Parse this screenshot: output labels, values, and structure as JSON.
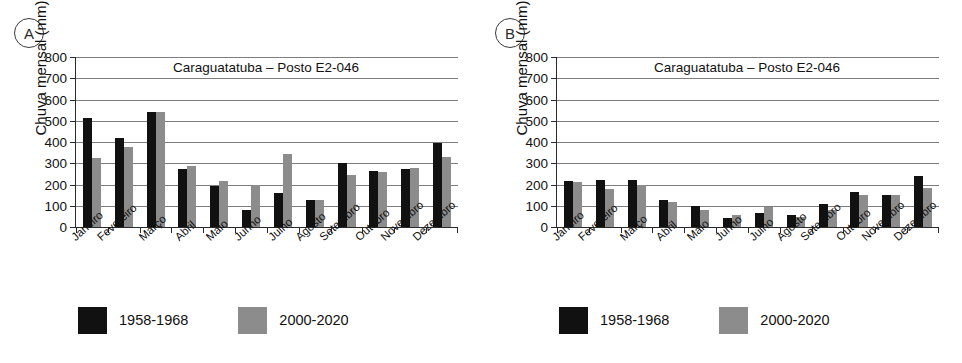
{
  "chart_data": [
    {
      "panel": "A",
      "type": "bar",
      "title": "Caraguatatuba – Posto E2-046",
      "xlabel": "",
      "ylabel": "Chuva mensal (mm)",
      "ylim": [
        0,
        800
      ],
      "yticks": [
        0,
        100,
        200,
        300,
        400,
        500,
        600,
        700,
        800
      ],
      "grid": true,
      "legend_position": "bottom",
      "categories": [
        "Janeiro",
        "Fevereiro",
        "Março",
        "Abril",
        "Maio",
        "Junho",
        "Julho",
        "Agosto",
        "Setembro",
        "Outubro",
        "Novembro",
        "Dezembro"
      ],
      "series": [
        {
          "name": "1958-1968",
          "color": "#111111",
          "values": [
            513,
            420,
            540,
            275,
            195,
            82,
            162,
            128,
            300,
            265,
            272,
            397
          ]
        },
        {
          "name": "2000-2020",
          "color": "#8c8c8c",
          "values": [
            325,
            375,
            540,
            285,
            218,
            198,
            345,
            125,
            245,
            260,
            277,
            330
          ]
        }
      ]
    },
    {
      "panel": "B",
      "type": "bar",
      "title": "Caraguatatuba – Posto E2-046",
      "xlabel": "",
      "ylabel": "Chuva mensal (mm)",
      "ylim": [
        0,
        800
      ],
      "yticks": [
        0,
        100,
        200,
        300,
        400,
        500,
        600,
        700,
        800
      ],
      "grid": true,
      "legend_position": "bottom",
      "categories": [
        "Janeiro",
        "Fevereiro",
        "Março",
        "Abril",
        "Maio",
        "Junho",
        "Julho",
        "Agosto",
        "Setembro",
        "Outubro",
        "Novembro",
        "Dezembro"
      ],
      "series": [
        {
          "name": "1958-1968",
          "color": "#111111",
          "values": [
            218,
            220,
            220,
            128,
            98,
            42,
            67,
            58,
            110,
            163,
            152,
            238
          ]
        },
        {
          "name": "2000-2020",
          "color": "#8c8c8c",
          "values": [
            210,
            178,
            197,
            120,
            78,
            57,
            92,
            45,
            80,
            152,
            153,
            185
          ]
        }
      ]
    }
  ],
  "panels": [
    {
      "tag": "A",
      "title": "Caraguatatuba – Posto E2-046",
      "ylabel": "Chuva mensal (mm)",
      "legend": [
        {
          "label": "1958-1968",
          "color": "#111111"
        },
        {
          "label": "2000-2020",
          "color": "#8c8c8c"
        }
      ]
    },
    {
      "tag": "B",
      "title": "Caraguatatuba – Posto E2-046",
      "ylabel": "Chuva mensal (mm)",
      "legend": [
        {
          "label": "1958-1968",
          "color": "#111111"
        },
        {
          "label": "2000-2020",
          "color": "#8c8c8c"
        }
      ]
    }
  ]
}
